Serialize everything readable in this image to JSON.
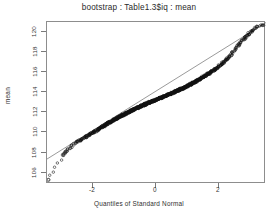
{
  "plot": {
    "title": "bootstrap : Table1.3$iq : mean",
    "xlabel": "Quantiles of Standard Normal",
    "ylabel": "mean"
  },
  "axes": {
    "y_ticks": [
      "106",
      "108",
      "110",
      "112",
      "114",
      "116",
      "118",
      "120"
    ],
    "x_ticks": [
      "-2",
      "0",
      "2"
    ]
  },
  "chart_data": {
    "type": "scatter",
    "title": "bootstrap : Table1.3$iq : mean",
    "subtitle": "",
    "xlabel": "Quantiles of Standard Normal",
    "ylabel": "mean",
    "grid": false,
    "legend": "none",
    "marker": "open-circle",
    "point_color": "#111111",
    "line_color": "#555555",
    "xlim": [
      -3.45,
      3.45
    ],
    "ylim": [
      105.4,
      121.3
    ],
    "xtick_values": [
      -2,
      0,
      2
    ],
    "ytick_values": [
      106,
      108,
      110,
      112,
      114,
      116,
      118,
      120
    ],
    "reference_line": {
      "description": "normal quantile-quantile reference line",
      "x": [
        -3.45,
        3.45
      ],
      "y": [
        107.85,
        121.25
      ]
    },
    "annotations": [
      "dense overplotted band of bootstrap replicate means along the reference line",
      "low-tail outliers fall below the reference line near x = -3.4 and x = -2.9",
      "upper tail points ride slightly above the reference line beyond x = 2.1"
    ],
    "series": [
      {
        "name": "bootstrap replicate means",
        "n_points_approx": 1000,
        "x": [
          -3.41,
          -2.95,
          -2.87,
          -2.72,
          -2.55,
          -2.44,
          -2.36,
          -2.28,
          -2.21,
          -2.14,
          -2.08,
          -2.02,
          -1.96,
          -1.91,
          -1.86,
          -1.81,
          -1.76,
          -1.72,
          -1.68,
          -1.64,
          -1.6,
          -1.56,
          -1.52,
          -1.49,
          -1.45,
          -1.42,
          -1.38,
          -1.35,
          -1.32,
          -1.29,
          -1.26,
          -1.23,
          -1.2,
          -1.17,
          -1.14,
          -1.11,
          -1.08,
          -1.06,
          -1.03,
          -1.0,
          -0.97,
          -0.95,
          -0.92,
          -0.9,
          -0.87,
          -0.84,
          -0.82,
          -0.79,
          -0.77,
          -0.74,
          -0.72,
          -0.69,
          -0.67,
          -0.64,
          -0.62,
          -0.6,
          -0.57,
          -0.55,
          -0.52,
          -0.5,
          -0.48,
          -0.45,
          -0.43,
          -0.41,
          -0.38,
          -0.36,
          -0.34,
          -0.31,
          -0.29,
          -0.27,
          -0.24,
          -0.22,
          -0.2,
          -0.17,
          -0.15,
          -0.13,
          -0.11,
          -0.08,
          -0.06,
          -0.04,
          -0.01,
          0.01,
          0.04,
          0.06,
          0.08,
          0.11,
          0.13,
          0.15,
          0.17,
          0.2,
          0.22,
          0.24,
          0.27,
          0.29,
          0.31,
          0.34,
          0.36,
          0.38,
          0.41,
          0.43,
          0.45,
          0.48,
          0.5,
          0.52,
          0.55,
          0.57,
          0.6,
          0.62,
          0.64,
          0.67,
          0.69,
          0.72,
          0.74,
          0.77,
          0.79,
          0.82,
          0.84,
          0.87,
          0.9,
          0.92,
          0.95,
          0.97,
          1.0,
          1.03,
          1.06,
          1.08,
          1.11,
          1.14,
          1.17,
          1.2,
          1.23,
          1.26,
          1.29,
          1.32,
          1.35,
          1.38,
          1.42,
          1.45,
          1.49,
          1.52,
          1.56,
          1.6,
          1.64,
          1.68,
          1.72,
          1.76,
          1.81,
          1.86,
          1.91,
          1.96,
          2.02,
          2.08,
          2.14,
          2.21,
          2.28,
          2.36,
          2.44,
          2.55,
          2.62,
          2.72,
          2.8,
          2.87,
          2.95,
          3.05,
          3.18,
          3.41
        ],
        "y": [
          105.8,
          108.25,
          108.55,
          108.95,
          109.45,
          109.62,
          109.78,
          109.92,
          110.05,
          110.18,
          110.3,
          110.42,
          110.52,
          110.62,
          110.72,
          110.81,
          110.9,
          110.98,
          111.06,
          111.14,
          111.21,
          111.28,
          111.35,
          111.42,
          111.48,
          111.54,
          111.6,
          111.66,
          111.72,
          111.77,
          111.83,
          111.88,
          111.93,
          111.98,
          112.03,
          112.08,
          112.13,
          112.17,
          112.22,
          112.26,
          112.31,
          112.35,
          112.39,
          112.43,
          112.47,
          112.51,
          112.55,
          112.59,
          112.63,
          112.67,
          112.7,
          112.74,
          112.78,
          112.81,
          112.85,
          112.88,
          112.92,
          112.95,
          112.99,
          113.02,
          113.05,
          113.09,
          113.12,
          113.15,
          113.18,
          113.22,
          113.25,
          113.28,
          113.31,
          113.34,
          113.37,
          113.4,
          113.43,
          113.46,
          113.49,
          113.52,
          113.55,
          113.58,
          113.61,
          113.64,
          113.67,
          113.7,
          113.73,
          113.76,
          113.79,
          113.82,
          113.85,
          113.88,
          113.91,
          113.94,
          113.97,
          114.0,
          114.03,
          114.06,
          114.09,
          114.12,
          114.15,
          114.18,
          114.21,
          114.24,
          114.27,
          114.31,
          114.34,
          114.37,
          114.4,
          114.44,
          114.47,
          114.5,
          114.54,
          114.57,
          114.61,
          114.64,
          114.68,
          114.72,
          114.75,
          114.79,
          114.83,
          114.87,
          114.91,
          114.95,
          114.99,
          115.03,
          115.07,
          115.12,
          115.16,
          115.21,
          115.25,
          115.3,
          115.35,
          115.4,
          115.45,
          115.5,
          115.56,
          115.61,
          115.67,
          115.73,
          115.79,
          115.86,
          115.92,
          115.99,
          116.07,
          116.14,
          116.22,
          116.31,
          116.4,
          116.49,
          116.59,
          116.7,
          116.82,
          116.95,
          117.1,
          117.26,
          117.44,
          117.64,
          117.88,
          118.15,
          118.46,
          118.9,
          119.15,
          119.5,
          119.78,
          120.0,
          120.25,
          120.55,
          120.85,
          121.05
        ]
      }
    ]
  }
}
